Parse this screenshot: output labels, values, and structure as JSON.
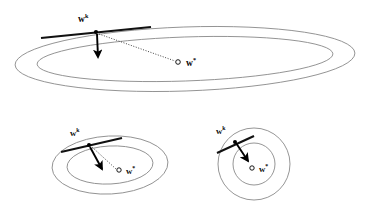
{
  "figure": {
    "title": "",
    "background_color": "#ffffff",
    "contour_color": "#8a8a8a",
    "arrow_color": "#000000",
    "tangent_color": "#111111",
    "dotted_color": "#444444",
    "panels": [
      {
        "id": "top-panel",
        "name": "ill-conditioned-contours",
        "shape": "very-elongated-ellipses",
        "labels": {
          "current_point": "w",
          "current_point_sup": "k",
          "optimum": "w",
          "optimum_sup": "*"
        },
        "ellipses": [
          {
            "cx": 185,
            "cy": 59,
            "rx": 170,
            "ry": 32,
            "rot": -2
          },
          {
            "cx": 185,
            "cy": 59,
            "rx": 148,
            "ry": 22,
            "rot": -2
          }
        ],
        "tangent_point": {
          "x": 96,
          "y": 32
        },
        "gradient_arrow": {
          "x1": 96,
          "y1": 33,
          "x2": 98,
          "y2": 60
        },
        "optimum_point": {
          "x": 178,
          "y": 62
        },
        "dotted_from": {
          "x": 99,
          "y": 33
        },
        "dotted_to": {
          "x": 175,
          "y": 61
        }
      },
      {
        "id": "bottom-left-panel",
        "name": "moderately-elongated-contours",
        "shape": "moderate-ellipses",
        "labels": {
          "current_point": "w",
          "current_point_sup": "k",
          "optimum": "w",
          "optimum_sup": "*"
        },
        "ellipses": [
          {
            "cx": 110,
            "cy": 165,
            "rx": 58,
            "ry": 29,
            "rot": -3
          },
          {
            "cx": 110,
            "cy": 165,
            "rx": 43,
            "ry": 19,
            "rot": -3
          }
        ],
        "tangent_point": {
          "x": 89,
          "y": 145
        },
        "gradient_arrow": {
          "x1": 90,
          "y1": 146,
          "x2": 104,
          "y2": 172
        },
        "optimum_point": {
          "x": 119,
          "y": 170
        },
        "dotted_from": {
          "x": 92,
          "y": 147
        },
        "dotted_to": {
          "x": 116,
          "y": 169
        }
      },
      {
        "id": "bottom-right-panel",
        "name": "well-conditioned-contours",
        "shape": "near-circles",
        "labels": {
          "current_point": "w",
          "current_point_sup": "k",
          "optimum": "w",
          "optimum_sup": "*"
        },
        "ellipses": [
          {
            "cx": 254,
            "cy": 164,
            "rx": 36,
            "ry": 36,
            "rot": 0
          },
          {
            "cx": 254,
            "cy": 164,
            "rx": 21,
            "ry": 21,
            "rot": 0
          }
        ],
        "tangent_point": {
          "x": 235,
          "y": 142
        },
        "gradient_arrow": {
          "x1": 236,
          "y1": 143,
          "x2": 250,
          "y2": 163
        },
        "optimum_point": {
          "x": 252,
          "y": 168
        },
        "dotted_from": null,
        "dotted_to": null
      }
    ]
  }
}
